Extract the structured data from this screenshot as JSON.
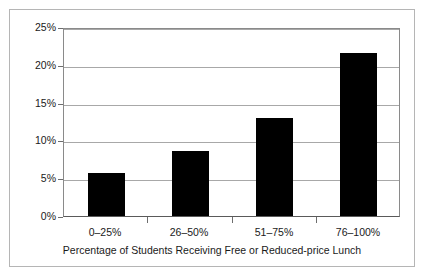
{
  "chart_data": {
    "type": "bar",
    "title": "",
    "subtitle": "",
    "categories": [
      "0–25%",
      "26–50%",
      "51–75%",
      "76–100%"
    ],
    "values": [
      5.7,
      8.6,
      13.0,
      21.6
    ],
    "value_labels": [
      "5.7%",
      "8.6%",
      "13.0%",
      "21.6%"
    ],
    "xlabel": "Percentage of Students Receiving Free or Reduced-price Lunch",
    "ylabel": "",
    "ylim": [
      0,
      25
    ],
    "ytick_values": [
      0,
      5,
      10,
      15,
      20,
      25
    ],
    "ytick_labels": [
      "0%",
      "5%",
      "10%",
      "15%",
      "20%",
      "25%"
    ],
    "grid": true,
    "grid_axis": "y",
    "legend": false,
    "legend_position": "none",
    "bar_color": "#000000",
    "grid_color": "#a8a8a8",
    "axis_color": "#6d6d6d",
    "frame_color": "#b5b5b5",
    "background_color": "#ffffff"
  },
  "figure": {
    "axis_title": "Percentage of Students Receiving Free or Reduced-price Lunch"
  }
}
